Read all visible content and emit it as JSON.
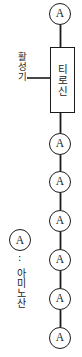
{
  "diagram": {
    "type": "biology-schematic",
    "stroke_color": "#1b1b1b",
    "background_color": "#ffffff",
    "backbone": {
      "node_label": "A",
      "node_count_above_residue": 1,
      "node_count_below_residue": 6,
      "nodes": [
        {
          "label": "A",
          "cx": 60,
          "cy": 14,
          "position": "above-residue"
        },
        {
          "label": "A",
          "cx": 60,
          "cy": 144,
          "position": "below-residue"
        },
        {
          "label": "A",
          "cx": 60,
          "cy": 182,
          "position": "below-residue"
        },
        {
          "label": "A",
          "cx": 60,
          "cy": 221,
          "position": "below-residue"
        },
        {
          "label": "A",
          "cx": 60,
          "cy": 260,
          "position": "below-residue"
        },
        {
          "label": "A",
          "cx": 60,
          "cy": 299,
          "position": "below-residue"
        },
        {
          "label": "A",
          "cx": 60,
          "cy": 338,
          "position": "below-residue"
        }
      ]
    },
    "residue_box": {
      "label": "티로신",
      "label_romanized": "tyrosine",
      "x": 50,
      "y": 47,
      "width": 25,
      "height": 66
    },
    "callout": {
      "label": "활성기",
      "label_romanized": "active group",
      "leader_line": {
        "x1": 27,
        "y1": 78,
        "x2": 50,
        "y2": 78
      }
    },
    "legend": {
      "symbol_label": "A",
      "separator": "∶",
      "description": "아미노산",
      "description_romanized": "amino acid"
    }
  }
}
